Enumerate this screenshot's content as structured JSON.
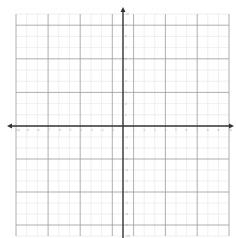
{
  "chart_data": {
    "type": "coordinate-grid",
    "title": "",
    "xlabel": "",
    "ylabel": "",
    "xlim": [
      -10,
      10
    ],
    "ylim": [
      -10,
      10
    ],
    "grid": true,
    "x_ticks": [
      -10,
      -9,
      -8,
      -7,
      -6,
      -5,
      -4,
      -3,
      -2,
      -1,
      1,
      2,
      3,
      4,
      5,
      6,
      7,
      8,
      9,
      10
    ],
    "y_ticks": [
      -10,
      -9,
      -8,
      -7,
      -6,
      -5,
      -4,
      -3,
      -2,
      -1,
      1,
      2,
      3,
      4,
      5,
      6,
      7,
      8,
      9,
      10
    ],
    "series": [],
    "axis_arrows": true
  },
  "colors": {
    "axis": "#333333",
    "major_grid": "#9a9a9a",
    "minor_grid": "#e4e4e4",
    "background": "#ffffff"
  }
}
